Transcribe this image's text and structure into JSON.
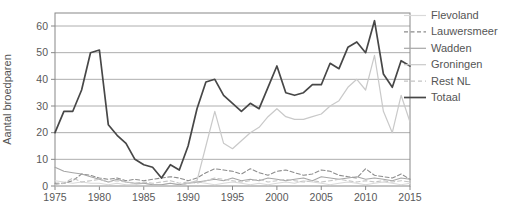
{
  "figure_title": "",
  "chart_data": {
    "type": "line",
    "title": "",
    "xlabel": "",
    "ylabel": "Aantal broedparen",
    "x": [
      1975,
      1976,
      1977,
      1978,
      1979,
      1980,
      1981,
      1982,
      1983,
      1984,
      1985,
      1986,
      1987,
      1988,
      1989,
      1990,
      1991,
      1992,
      1993,
      1994,
      1995,
      1996,
      1997,
      1998,
      1999,
      2000,
      2001,
      2002,
      2003,
      2004,
      2005,
      2006,
      2007,
      2008,
      2009,
      2010,
      2011,
      2012,
      2013,
      2014,
      2015
    ],
    "x_tick_labels": [
      "1975",
      "1980",
      "1985",
      "1990",
      "1995",
      "2000",
      "2005",
      "2010",
      "2015"
    ],
    "x_ticks": [
      1975,
      1980,
      1985,
      1990,
      1995,
      2000,
      2005,
      2010,
      2015
    ],
    "y_ticks": [
      0,
      10,
      20,
      30,
      40,
      50,
      60
    ],
    "ylim": [
      0,
      65
    ],
    "xlim": [
      1975,
      2015
    ],
    "grid": "horizontal",
    "legend_position": "right",
    "colors": {
      "grid": "#999999",
      "frame": "#888888",
      "tick_text": "#595959",
      "legend_text": "#555555"
    },
    "series": [
      {
        "name": "Flevoland",
        "color": "#d9d9d9",
        "dash": "",
        "width": 1.1,
        "values": [
          2,
          1.5,
          1,
          1.5,
          1,
          1,
          0.5,
          1,
          0.5,
          0.5,
          1,
          0.5,
          0.5,
          1,
          0.5,
          1,
          1.5,
          1,
          0.5,
          1,
          1.5,
          1,
          0.5,
          1,
          0.5,
          1,
          1.5,
          1,
          2,
          1.5,
          1,
          0.5,
          1,
          1.5,
          1,
          0.5,
          1,
          1.5,
          1,
          0.5,
          1
        ]
      },
      {
        "name": "Lauwersmeer",
        "color": "#8c8c8c",
        "dash": "4 2.5",
        "width": 1.1,
        "values": [
          1,
          1,
          2,
          4.5,
          4,
          3,
          2.5,
          3,
          2,
          2.5,
          2,
          2.5,
          3,
          3.5,
          3,
          2,
          3,
          5,
          6.5,
          6,
          5.5,
          4.5,
          6.5,
          5,
          4,
          5.5,
          6,
          5,
          4,
          4.5,
          6,
          5.5,
          4,
          3.5,
          3,
          6.5,
          4,
          3.5,
          3,
          4.5,
          2.5
        ]
      },
      {
        "name": "Wadden",
        "color": "#a6a6a6",
        "dash": "",
        "width": 1.1,
        "values": [
          7,
          5.5,
          5,
          4.5,
          3.5,
          2.5,
          1.5,
          2.5,
          1.5,
          1,
          1,
          0.5,
          0.5,
          1,
          0.5,
          1,
          1.5,
          2,
          2.5,
          2,
          3,
          2,
          2.5,
          2,
          3,
          2.5,
          2,
          2.5,
          3,
          2,
          3.5,
          3,
          2.5,
          3,
          3.5,
          2.5,
          3,
          2.5,
          2,
          3,
          2.5
        ]
      },
      {
        "name": "Groningen",
        "color": "#c9c9c9",
        "dash": "",
        "width": 1.2,
        "values": [
          0,
          0,
          0,
          0,
          0,
          0,
          0,
          0,
          0,
          0,
          0,
          0,
          0,
          0,
          0,
          1,
          2,
          15,
          28,
          16,
          14,
          17,
          20,
          22,
          26,
          29,
          26,
          25,
          25,
          26,
          27,
          30,
          32,
          37,
          40,
          36,
          49,
          28,
          20,
          34,
          24
        ]
      },
      {
        "name": "Rest NL",
        "color": "#c4c4c4",
        "dash": "4 3",
        "width": 1.1,
        "values": [
          0.5,
          1,
          3,
          1.5,
          2,
          2.5,
          1.5,
          2,
          1.5,
          1,
          1.5,
          1,
          1.5,
          2,
          1,
          1.5,
          1,
          2,
          3,
          2.5,
          2,
          1.5,
          2,
          2.5,
          1.5,
          2,
          2.5,
          2,
          1.5,
          2,
          1.5,
          2,
          2.5,
          2,
          1.5,
          2,
          1.5,
          2,
          1.5,
          2,
          1.5
        ]
      },
      {
        "name": "Totaal",
        "color": "#474747",
        "dash": "",
        "width": 1.7,
        "values": [
          20,
          28,
          28,
          36,
          50,
          51,
          23,
          19,
          16,
          10,
          8,
          7,
          3,
          8,
          6,
          15,
          29,
          39,
          40,
          34,
          31,
          28,
          31,
          29,
          37,
          45,
          35,
          34,
          35,
          38,
          38,
          46,
          44,
          52,
          54,
          50,
          62,
          42,
          37,
          47,
          45
        ]
      }
    ]
  }
}
